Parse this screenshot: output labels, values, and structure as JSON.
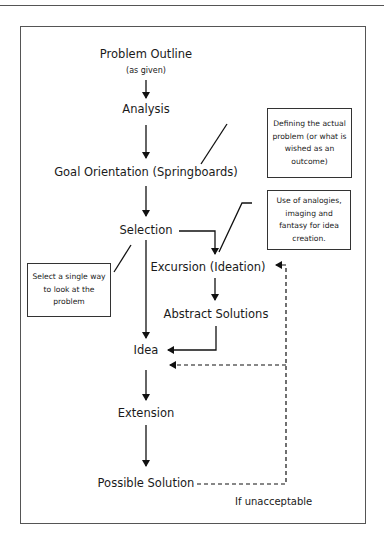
{
  "diagram": {
    "nodes": {
      "problem_outline": "Problem Outline",
      "problem_outline_sub": "(as given)",
      "analysis": "Analysis",
      "goal_orientation": "Goal Orientation (Springboards)",
      "selection": "Selection",
      "excursion": "Excursion (Ideation)",
      "abstract_solutions": "Abstract Solutions",
      "idea": "Idea",
      "extension": "Extension",
      "possible_solution": "Possible Solution"
    },
    "notes": {
      "goal_note": "Defining the actual problem (or what is wished as an outcome)",
      "excursion_note": "Use of analogies, imaging and fantasy for idea creation.",
      "selection_note": "Select a single way to look at the problem"
    },
    "loop_label": "If unacceptable",
    "edges": [
      {
        "from": "Problem Outline",
        "to": "Analysis",
        "style": "solid"
      },
      {
        "from": "Analysis",
        "to": "Goal Orientation (Springboards)",
        "style": "solid"
      },
      {
        "from": "Goal Orientation (Springboards)",
        "to": "Selection",
        "style": "solid"
      },
      {
        "from": "Selection",
        "to": "Idea",
        "style": "solid"
      },
      {
        "from": "Selection",
        "to": "Excursion (Ideation)",
        "style": "solid"
      },
      {
        "from": "Excursion (Ideation)",
        "to": "Abstract Solutions",
        "style": "solid"
      },
      {
        "from": "Abstract Solutions",
        "to": "Idea",
        "style": "solid"
      },
      {
        "from": "Idea",
        "to": "Extension",
        "style": "solid"
      },
      {
        "from": "Extension",
        "to": "Possible Solution",
        "style": "solid"
      },
      {
        "from": "Possible Solution",
        "to": "Excursion (Ideation)",
        "style": "dashed",
        "label": "If unacceptable"
      },
      {
        "from": "Possible Solution",
        "to": "Idea",
        "style": "dashed",
        "label": "If unacceptable"
      }
    ]
  }
}
